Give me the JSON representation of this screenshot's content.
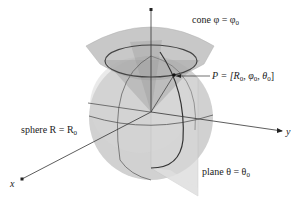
{
  "diagram": {
    "labels": {
      "cone": "cone φ = φ",
      "cone_sub": "0",
      "point_prefix": "P = [R",
      "point_sub1": "0",
      "point_mid1": ", φ",
      "point_sub2": "0",
      "point_mid2": ", θ",
      "point_sub3": "0",
      "point_suffix": "]",
      "sphere": "sphere R = R",
      "sphere_sub": "0",
      "plane": "plane θ = θ",
      "plane_sub": "0",
      "axis_x": "x",
      "axis_y": "y",
      "axis_z": "z"
    },
    "colors": {
      "sphere_fill": "#c8c8c8",
      "cone_fill": "#b4b4b4",
      "plane_fill": "#d6d6d6",
      "line": "#444444",
      "axis": "#333333",
      "background": "#ffffff"
    }
  }
}
